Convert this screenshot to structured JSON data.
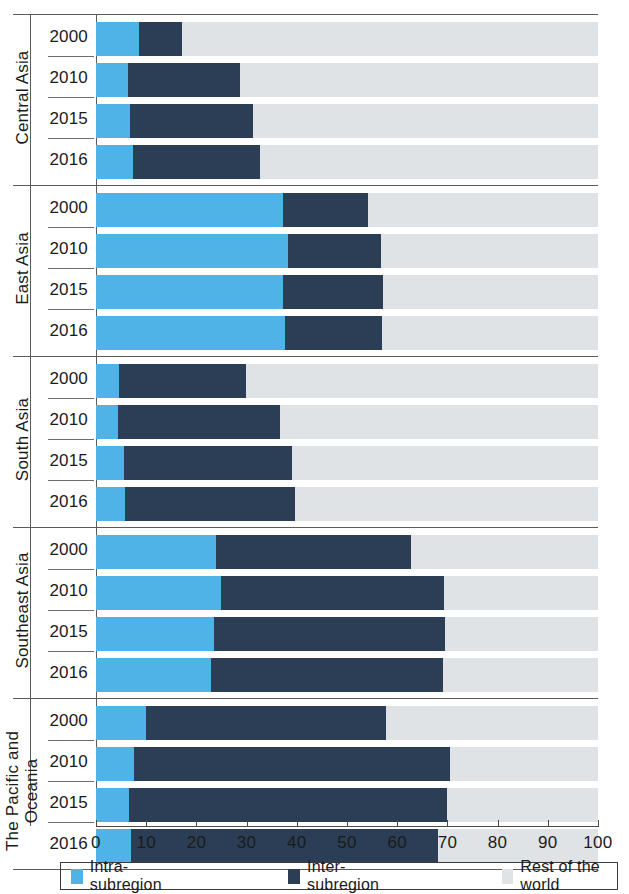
{
  "chart_data": {
    "type": "bar",
    "subtype": "horizontal-stacked-100",
    "title": "",
    "xlabel": "",
    "ylabel": "",
    "xlim": [
      0,
      100
    ],
    "xticks": [
      0,
      10,
      20,
      30,
      40,
      50,
      60,
      70,
      80,
      90,
      100
    ],
    "xtick_labels": [
      "0",
      "10",
      "20",
      "30",
      "40",
      "50",
      "60",
      "70",
      "80",
      "90",
      "100"
    ],
    "grid": false,
    "legend_position": "bottom",
    "series_names": [
      "Intra-subregion",
      "Inter-subregion",
      "Rest of the world"
    ],
    "series_colors": [
      "#4FB3E8",
      "#2B3E55",
      "#DFE3E6"
    ],
    "groups": [
      {
        "region": "Central Asia",
        "rows": [
          {
            "year": "2000",
            "intra": 8.5,
            "inter": 8.6,
            "rest": 82.9
          },
          {
            "year": "2010",
            "intra": 6.4,
            "inter": 22.3,
            "rest": 71.3
          },
          {
            "year": "2015",
            "intra": 6.8,
            "inter": 24.5,
            "rest": 68.7
          },
          {
            "year": "2016",
            "intra": 7.4,
            "inter": 25.2,
            "rest": 67.4
          }
        ]
      },
      {
        "region": "East Asia",
        "rows": [
          {
            "year": "2000",
            "intra": 37.3,
            "inter": 16.8,
            "rest": 45.9
          },
          {
            "year": "2010",
            "intra": 38.2,
            "inter": 18.5,
            "rest": 43.3
          },
          {
            "year": "2015",
            "intra": 37.3,
            "inter": 19.8,
            "rest": 42.9
          },
          {
            "year": "2016",
            "intra": 37.6,
            "inter": 19.4,
            "rest": 43.0
          }
        ]
      },
      {
        "region": "South Asia",
        "rows": [
          {
            "year": "2000",
            "intra": 4.6,
            "inter": 25.3,
            "rest": 70.1
          },
          {
            "year": "2010",
            "intra": 4.4,
            "inter": 32.3,
            "rest": 63.3
          },
          {
            "year": "2015",
            "intra": 5.6,
            "inter": 33.4,
            "rest": 61.0
          },
          {
            "year": "2016",
            "intra": 5.8,
            "inter": 33.8,
            "rest": 60.4
          }
        ]
      },
      {
        "region": "Southeast Asia",
        "rows": [
          {
            "year": "2000",
            "intra": 23.9,
            "inter": 38.8,
            "rest": 37.3
          },
          {
            "year": "2010",
            "intra": 24.9,
            "inter": 44.4,
            "rest": 30.7
          },
          {
            "year": "2015",
            "intra": 23.5,
            "inter": 46.0,
            "rest": 30.5
          },
          {
            "year": "2016",
            "intra": 22.9,
            "inter": 46.2,
            "rest": 30.9
          }
        ]
      },
      {
        "region": "The Pacific and\nOceania",
        "rows": [
          {
            "year": "2000",
            "intra": 10.0,
            "inter": 47.8,
            "rest": 42.2
          },
          {
            "year": "2010",
            "intra": 7.6,
            "inter": 62.9,
            "rest": 29.5
          },
          {
            "year": "2015",
            "intra": 6.6,
            "inter": 63.3,
            "rest": 30.1
          },
          {
            "year": "2016",
            "intra": 6.9,
            "inter": 61.2,
            "rest": 31.9
          }
        ]
      }
    ]
  },
  "legend": {
    "items": [
      {
        "label": "Intra-subregion",
        "color": "#4FB3E8"
      },
      {
        "label": "Inter-subregion",
        "color": "#2B3E55"
      },
      {
        "label": "Rest of the world",
        "color": "#DFE3E6"
      }
    ]
  }
}
